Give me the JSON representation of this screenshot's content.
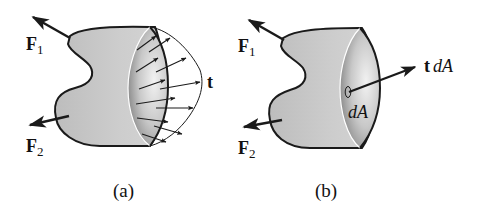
{
  "figure": {
    "panels": [
      {
        "id": "a",
        "caption": "(a)",
        "forces": [
          {
            "symbol": "F",
            "subscript": "1"
          },
          {
            "symbol": "F",
            "subscript": "2"
          }
        ],
        "traction_label": "t",
        "description": "Sectioned body with distributed traction vectors t over the cut surface"
      },
      {
        "id": "b",
        "caption": "(b)",
        "forces": [
          {
            "symbol": "F",
            "subscript": "1"
          },
          {
            "symbol": "F",
            "subscript": "2"
          }
        ],
        "traction_label_bold": "t",
        "traction_label_ital": "dA",
        "area_label": "dA",
        "description": "Sectioned body with traction force t dA acting on area element dA"
      }
    ]
  },
  "colors": {
    "body_fill": "#c9c9c9",
    "outline": "#1a1a1a",
    "arrow": "#1a1a1a",
    "background": "#ffffff"
  }
}
